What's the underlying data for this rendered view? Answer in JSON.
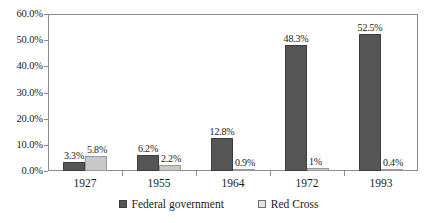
{
  "chart_data": {
    "type": "bar",
    "title": "",
    "subtitle": "",
    "xlabel": "",
    "ylabel": "",
    "categories": [
      "1927",
      "1955",
      "1964",
      "1972",
      "1993"
    ],
    "series": [
      {
        "name": "Federal government",
        "color": "#555555",
        "values": [
          3.3,
          6.2,
          12.8,
          48.3,
          52.5
        ],
        "labels": [
          "3.3%",
          "6.2%",
          "12.8%",
          "48.3%",
          "52.5%"
        ]
      },
      {
        "name": "Red Cross",
        "color": "#c8c8c8",
        "values": [
          5.8,
          2.2,
          0.9,
          1,
          0.4
        ],
        "labels": [
          "5.8%",
          "2.2%",
          "0.9%",
          "1%",
          "0.4%"
        ]
      }
    ],
    "ylim": [
      0,
      60
    ],
    "y_tick_values": [
      0,
      10,
      20,
      30,
      40,
      50,
      60
    ],
    "y_tick_labels": [
      "0.0%",
      "10.0%",
      "20.0%",
      "30.0%",
      "40.0%",
      "50.0%",
      "60.0%"
    ],
    "grid": false,
    "legend_position": "bottom",
    "frame": true,
    "frame_color": "#8c8c8c",
    "background": "#ffffff"
  }
}
